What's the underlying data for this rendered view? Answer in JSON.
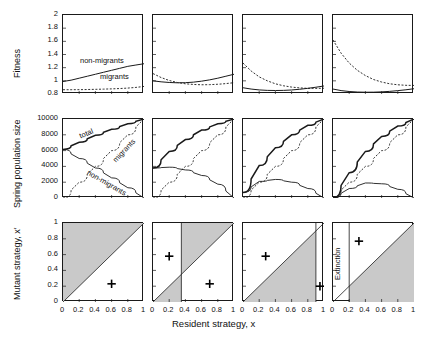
{
  "figure": {
    "axis_labels": {
      "row1_y": "Fitness",
      "row2_y": "Spring population size",
      "row3_y": "Mutant strategy, x′",
      "x": "Resident strategy, x"
    },
    "panel_titles": [
      {
        "letter": "(a)",
        "param": "s",
        "sub": "n",
        "eq": "= 0.42"
      },
      {
        "letter": "(b)",
        "param": "s",
        "sub": "n",
        "eq": "= 0.38"
      },
      {
        "letter": "(c)",
        "param": "s",
        "sub": "n",
        "eq": "= 0.34"
      },
      {
        "letter": "(d)",
        "param": "s",
        "sub": "n",
        "eq": "= 0.30"
      }
    ],
    "curve_labels": {
      "non_migrants": "non-migrants",
      "migrants": "migrants",
      "total": "total",
      "extinction": "Extinction"
    },
    "ticks": {
      "row1_y": [
        "2",
        "1.8",
        "1.6",
        "1.4",
        "1.2",
        "1",
        "0.8"
      ],
      "row2_y": [
        "10000",
        "8000",
        "6000",
        "4000",
        "2000",
        "0"
      ],
      "row3_y": [
        "1",
        "0.8",
        "0.6",
        "0.4",
        "0.2",
        "0"
      ],
      "x": [
        "0",
        "0.2",
        "0.4",
        "0.6",
        "0.8",
        "1"
      ]
    },
    "colors": {
      "line": "#1a1a1a",
      "shade": "#c9c9c9",
      "background": "#ffffff"
    }
  },
  "chart_data": {
    "type": "line",
    "title": "",
    "xlabel": "Resident strategy, x",
    "panels": [
      {
        "letter": "(a)",
        "sn": 0.42,
        "row1": {
          "ylabel": "Fitness",
          "ylim": [
            0.8,
            2
          ],
          "xlim": [
            0,
            1
          ],
          "series": [
            {
              "name": "non-migrants",
              "style": "solid",
              "x": [
                0,
                0.1,
                0.2,
                0.3,
                0.4,
                0.5,
                0.6,
                0.7,
                0.8,
                0.9,
                1
              ],
              "y": [
                0.99,
                1.01,
                1.04,
                1.07,
                1.1,
                1.13,
                1.16,
                1.19,
                1.22,
                1.24,
                1.26
              ]
            },
            {
              "name": "migrants",
              "style": "dotted",
              "x": [
                0,
                0.1,
                0.2,
                0.3,
                0.4,
                0.5,
                0.6,
                0.7,
                0.8,
                0.9,
                1
              ],
              "y": [
                0.865,
                0.865,
                0.866,
                0.868,
                0.871,
                0.874,
                0.878,
                0.883,
                0.89,
                0.9,
                0.915
              ]
            }
          ]
        },
        "row2": {
          "ylabel": "Spring population size",
          "ylim": [
            0,
            10000
          ],
          "xlim": [
            0,
            1
          ],
          "series": [
            {
              "name": "total",
              "style": "solid-thick",
              "x": [
                0,
                0.2,
                0.4,
                0.6,
                0.8,
                1
              ],
              "y": [
                6150,
                7050,
                7950,
                8700,
                9400,
                10000
              ]
            },
            {
              "name": "non-migrants",
              "style": "solid",
              "x": [
                0,
                0.2,
                0.4,
                0.6,
                0.8,
                1
              ],
              "y": [
                6150,
                5000,
                3800,
                2550,
                1300,
                0
              ]
            },
            {
              "name": "migrants",
              "style": "dotted",
              "x": [
                0,
                0.2,
                0.4,
                0.6,
                0.8,
                1
              ],
              "y": [
                0,
                2000,
                4000,
                6000,
                8000,
                10000
              ]
            }
          ]
        },
        "row3": {
          "ylabel": "Mutant strategy, x′",
          "ylim": [
            0,
            1
          ],
          "xlim": [
            0,
            1
          ],
          "shaded_regions": [
            {
              "x_from": 0,
              "x_to": 1,
              "side": "above-diagonal"
            }
          ],
          "plus_markers": [
            {
              "x": 0.6,
              "y": 0.23
            }
          ],
          "singular_strategies": []
        }
      },
      {
        "letter": "(b)",
        "sn": 0.38,
        "row1": {
          "ylabel": "Fitness",
          "ylim": [
            0.8,
            2
          ],
          "xlim": [
            0,
            1
          ],
          "series": [
            {
              "name": "non-migrants",
              "style": "solid",
              "x": [
                0,
                0.1,
                0.2,
                0.3,
                0.4,
                0.5,
                0.6,
                0.7,
                0.8,
                0.9,
                1
              ],
              "y": [
                1.0,
                0.985,
                0.975,
                0.97,
                0.972,
                0.98,
                0.995,
                1.015,
                1.04,
                1.07,
                1.1
              ]
            },
            {
              "name": "migrants",
              "style": "dotted",
              "x": [
                0,
                0.1,
                0.2,
                0.3,
                0.4,
                0.5,
                0.6,
                0.7,
                0.8,
                0.9,
                1
              ],
              "y": [
                1.11,
                1.05,
                1.005,
                0.975,
                0.955,
                0.945,
                0.94,
                0.942,
                0.948,
                0.958,
                0.972
              ]
            }
          ]
        },
        "row2": {
          "ylabel": "Spring population size",
          "ylim": [
            0,
            10000
          ],
          "xlim": [
            0,
            1
          ],
          "series": [
            {
              "name": "total",
              "style": "solid-thick",
              "x": [
                0,
                0.2,
                0.4,
                0.6,
                0.8,
                1
              ],
              "y": [
                3800,
                5900,
                7400,
                8600,
                9400,
                10000
              ]
            },
            {
              "name": "non-migrants",
              "style": "solid",
              "x": [
                0,
                0.2,
                0.4,
                0.6,
                0.8,
                1
              ],
              "y": [
                3800,
                3900,
                3550,
                2850,
                1750,
                0
              ]
            },
            {
              "name": "migrants",
              "style": "dotted",
              "x": [
                0,
                0.2,
                0.4,
                0.6,
                0.8,
                1
              ],
              "y": [
                0,
                2000,
                4000,
                6000,
                8000,
                10000
              ]
            }
          ]
        },
        "row3": {
          "ylabel": "Mutant strategy, x′",
          "ylim": [
            0,
            1
          ],
          "xlim": [
            0,
            1
          ],
          "shaded_regions": [
            {
              "x_from": 0,
              "x_to": 0.35,
              "side": "below-diagonal"
            },
            {
              "x_from": 0.35,
              "x_to": 1,
              "side": "above-diagonal"
            }
          ],
          "plus_markers": [
            {
              "x": 0.2,
              "y": 0.58
            },
            {
              "x": 0.7,
              "y": 0.23
            }
          ],
          "singular_strategies": [
            0.35
          ]
        }
      },
      {
        "letter": "(c)",
        "sn": 0.34,
        "row1": {
          "ylabel": "Fitness",
          "ylim": [
            0.8,
            2
          ],
          "xlim": [
            0,
            1
          ],
          "series": [
            {
              "name": "non-migrants",
              "style": "solid",
              "x": [
                0,
                0.1,
                0.2,
                0.3,
                0.4,
                0.5,
                0.6,
                0.7,
                0.8,
                0.9,
                1
              ],
              "y": [
                0.895,
                0.875,
                0.862,
                0.855,
                0.853,
                0.855,
                0.861,
                0.872,
                0.886,
                0.903,
                0.922
              ]
            },
            {
              "name": "migrants",
              "style": "dotted",
              "x": [
                0,
                0.1,
                0.2,
                0.3,
                0.4,
                0.5,
                0.6,
                0.7,
                0.8,
                0.9,
                1
              ],
              "y": [
                1.27,
                1.15,
                1.06,
                1.0,
                0.955,
                0.925,
                0.905,
                0.893,
                0.886,
                0.885,
                0.888
              ]
            }
          ]
        },
        "row2": {
          "ylabel": "Spring population size",
          "ylim": [
            0,
            10000
          ],
          "xlim": [
            0,
            1
          ],
          "series": [
            {
              "name": "total",
              "style": "solid-thick",
              "x": [
                0,
                0.2,
                0.4,
                0.6,
                0.8,
                1
              ],
              "y": [
                700,
                4100,
                6350,
                8000,
                9200,
                10000
              ]
            },
            {
              "name": "non-migrants",
              "style": "solid",
              "x": [
                0,
                0.2,
                0.4,
                0.6,
                0.8,
                1
              ],
              "y": [
                700,
                2100,
                2350,
                2000,
                1200,
                0
              ]
            },
            {
              "name": "migrants",
              "style": "dotted",
              "x": [
                0,
                0.2,
                0.4,
                0.6,
                0.8,
                1
              ],
              "y": [
                0,
                2000,
                4000,
                6000,
                8000,
                10000
              ]
            }
          ]
        },
        "row3": {
          "ylabel": "Mutant strategy, x′",
          "ylim": [
            0,
            1
          ],
          "xlim": [
            0,
            1
          ],
          "shaded_regions": [
            {
              "x_from": 0,
              "x_to": 0.9,
              "side": "below-diagonal"
            }
          ],
          "plus_markers": [
            {
              "x": 0.28,
              "y": 0.58
            },
            {
              "x": 0.95,
              "y": 0.2
            }
          ],
          "singular_strategies": [
            0.9
          ]
        }
      },
      {
        "letter": "(d)",
        "sn": 0.3,
        "row1": {
          "ylabel": "Fitness",
          "ylim": [
            0.8,
            2
          ],
          "xlim": [
            0,
            1
          ],
          "series": [
            {
              "name": "non-migrants",
              "style": "solid",
              "x": [
                0,
                0.1,
                0.2,
                0.3,
                0.4,
                0.5,
                0.6,
                0.7,
                0.8,
                0.9,
                1
              ],
              "y": [
                0.875,
                0.852,
                0.838,
                0.83,
                0.827,
                0.828,
                0.832,
                0.84,
                0.851,
                0.864,
                0.88
              ]
            },
            {
              "name": "migrants",
              "style": "dotted",
              "x": [
                0,
                0.1,
                0.2,
                0.3,
                0.4,
                0.5,
                0.6,
                0.7,
                0.8,
                0.9,
                1
              ],
              "y": [
                1.62,
                1.42,
                1.27,
                1.16,
                1.08,
                1.02,
                0.982,
                0.955,
                0.94,
                0.932,
                0.93
              ]
            }
          ]
        },
        "row2": {
          "ylabel": "Spring population size",
          "ylim": [
            0,
            10000
          ],
          "xlim": [
            0,
            1
          ],
          "series": [
            {
              "name": "total",
              "style": "solid-thick",
              "x": [
                0,
                0.2,
                0.4,
                0.6,
                0.8,
                1
              ],
              "y": [
                0,
                3200,
                5900,
                7800,
                9100,
                10000
              ]
            },
            {
              "name": "non-migrants",
              "style": "solid",
              "x": [
                0,
                0.2,
                0.4,
                0.6,
                0.8,
                1
              ],
              "y": [
                0,
                1200,
                1900,
                1800,
                1100,
                0
              ]
            },
            {
              "name": "migrants",
              "style": "dotted",
              "x": [
                0,
                0.2,
                0.4,
                0.6,
                0.8,
                1
              ],
              "y": [
                0,
                2000,
                4000,
                6000,
                8000,
                10000
              ]
            }
          ]
        },
        "row3": {
          "ylabel": "Mutant strategy, x′",
          "ylim": [
            0,
            1
          ],
          "xlim": [
            0,
            1
          ],
          "shaded_regions": [
            {
              "x_from": 0.2,
              "x_to": 1,
              "side": "below-diagonal"
            }
          ],
          "plus_markers": [
            {
              "x": 0.32,
              "y": 0.77
            }
          ],
          "singular_strategies": [
            0.2
          ],
          "annotation": "Extinction"
        }
      }
    ]
  }
}
